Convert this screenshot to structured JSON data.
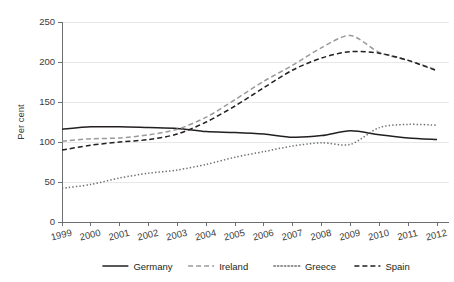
{
  "chart_data": {
    "type": "line",
    "title": "",
    "subtitle": "",
    "xlabel": "",
    "ylabel": "Per cent",
    "x": [
      1999,
      2000,
      2001,
      2002,
      2003,
      2004,
      2005,
      2006,
      2007,
      2008,
      2009,
      2010,
      2011,
      2012
    ],
    "categories": [
      "1999",
      "2000",
      "2001",
      "2002",
      "2003",
      "2004",
      "2005",
      "2006",
      "2007",
      "2008",
      "2009",
      "2010",
      "2011",
      "2012"
    ],
    "xlim": [
      1999,
      2012
    ],
    "ylim": [
      0,
      250
    ],
    "yticks": [
      0,
      50,
      100,
      150,
      200,
      250
    ],
    "ytick_labels": [
      "0",
      "50",
      "100",
      "150",
      "200",
      "250"
    ],
    "grid": "horizontal",
    "legend_position": "bottom",
    "series": [
      {
        "name": "Germany",
        "style": "solid",
        "color": "#231f20",
        "values": [
          116,
          119,
          119,
          118,
          117,
          113,
          112,
          110,
          106,
          108,
          114,
          109,
          105,
          103
        ]
      },
      {
        "name": "Ireland",
        "style": "dashed",
        "color": "#9a9a9a",
        "values": [
          101,
          104,
          105,
          109,
          116,
          131,
          153,
          176,
          196,
          218,
          233,
          212,
          202,
          190
        ]
      },
      {
        "name": "Greece",
        "style": "dotted",
        "color": "#6d6e71",
        "values": [
          42,
          47,
          55,
          61,
          65,
          72,
          81,
          88,
          95,
          99,
          97,
          118,
          122,
          121
        ]
      },
      {
        "name": "Spain",
        "style": "dashed",
        "color": "#231f20",
        "values": [
          90,
          96,
          100,
          103,
          110,
          125,
          145,
          168,
          190,
          205,
          213,
          211,
          202,
          189
        ]
      }
    ]
  },
  "axis": {
    "y_label": "Per cent",
    "y_ticks": [
      "250",
      "200",
      "150",
      "100",
      "50",
      "0"
    ],
    "x_ticks": [
      "1999",
      "2000",
      "2001",
      "2002",
      "2003",
      "2004",
      "2005",
      "2006",
      "2007",
      "2008",
      "2009",
      "2010",
      "2011",
      "2012"
    ]
  },
  "legend": {
    "items": [
      {
        "label": "Germany",
        "swatch": "solid-line-swatch"
      },
      {
        "label": "Ireland",
        "swatch": "dashed-line-swatch"
      },
      {
        "label": "Greece",
        "swatch": "dotted-line-swatch"
      },
      {
        "label": "Spain",
        "swatch": "dark-dashed-line-swatch"
      }
    ]
  },
  "colors": {
    "germany": "#231f20",
    "ireland": "#9a9a9a",
    "greece": "#6d6e71",
    "spain": "#231f20",
    "grid": "#e8e8e8",
    "axis": "#6d6e71",
    "background": "#ffffff"
  }
}
